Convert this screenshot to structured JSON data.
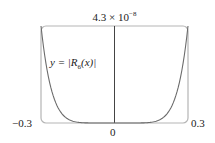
{
  "chart_data": {
    "type": "line",
    "title": "",
    "xlabel": "",
    "ylabel": "",
    "xlim": [
      -0.3,
      0.3
    ],
    "ylim": [
      0,
      4.3e-08
    ],
    "x_tick_labels": [
      "-0.3",
      "0",
      "0.3"
    ],
    "y_tick_labels": [
      "4.3 × 10⁻⁸"
    ],
    "grid": false,
    "legend": null,
    "annotations": [
      "y = |R6(x)|"
    ],
    "series": [
      {
        "name": "y = |R6(x)|",
        "x": [
          -0.3,
          -0.25,
          -0.2,
          -0.15,
          -0.1,
          -0.05,
          0,
          0.05,
          0.1,
          0.15,
          0.2,
          0.25,
          0.3
        ],
        "values": [
          4.3e-08,
          1.2e-08,
          2e-09,
          1.5e-10,
          5e-12,
          3e-14,
          0,
          3e-14,
          5e-12,
          1.5e-10,
          2e-09,
          1.2e-08,
          4.3e-08
        ]
      }
    ]
  },
  "labels": {
    "ymax": "4.3 × 10",
    "ymax_exp": "−8",
    "xmin": "−0.3",
    "xmax": "0.3",
    "zero": "0",
    "curve_prefix": "y = |",
    "curve_R": "R",
    "curve_sub": "6",
    "curve_arg": "(x)|"
  },
  "colors": {
    "frame": "#b5b5b5",
    "curve": "#6b6b6b",
    "axis": "#444444"
  }
}
